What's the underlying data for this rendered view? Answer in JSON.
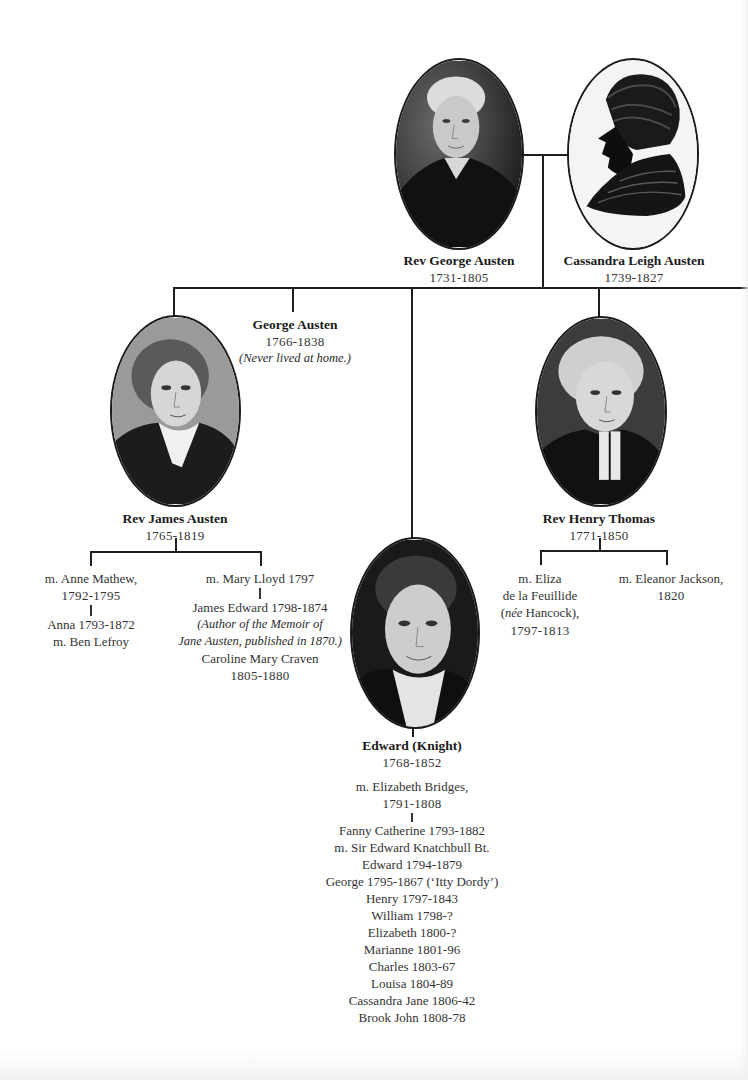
{
  "parents": {
    "father": {
      "name": "Rev George Austen",
      "dates": "1731-1805",
      "portrait": "portrait-painted"
    },
    "mother": {
      "name": "Cassandra Leigh Austen",
      "dates": "1739-1827",
      "portrait": "silhouette"
    }
  },
  "children": {
    "james": {
      "name": "Rev James Austen",
      "dates": "1765-1819",
      "marriages": [
        {
          "spouse": "m. Anne Mathew,",
          "years": "1792-1795",
          "children": [
            "Anna 1793-1872",
            "m. Ben Lefroy"
          ]
        },
        {
          "spouse": "m. Mary Lloyd 1797",
          "children_line1": "James Edward 1798-1874",
          "note_line1": "(Author of the Memoir of",
          "note_line2": "Jane Austen, published in 1870.)",
          "child2_name": "Caroline Mary Craven",
          "child2_dates": "1805-1880"
        }
      ]
    },
    "george": {
      "name": "George Austen",
      "dates": "1766-1838",
      "note": "(Never lived at home.)"
    },
    "edward": {
      "name": "Edward (Knight)",
      "dates": "1768-1852",
      "marriage": {
        "spouse": "m. Elizabeth Bridges,",
        "years": "1791-1808"
      },
      "children": [
        "Fanny Catherine  1793-1882",
        "m. Sir Edward Knatchbull Bt.",
        "Edward 1794-1879",
        "George 1795-1867 (‘Itty Dordy’)",
        "Henry 1797-1843",
        "William 1798-?",
        "Elizabeth 1800-?",
        "Marianne 1801-96",
        "Charles 1803-67",
        "Louisa 1804-89",
        "Cassandra Jane 1806-42",
        "Brook John 1808-78"
      ]
    },
    "henry": {
      "name": "Rev Henry Thomas",
      "dates": "1771-1850",
      "marriages": [
        {
          "line1": "m. Eliza",
          "line2": "de la Feuillide",
          "line3_italic": "née",
          "line3_rest": " Hancock),",
          "line3_open": "(",
          "years": "1797-1813"
        },
        {
          "line1": "m. Eleanor Jackson,",
          "years": "1820"
        }
      ]
    }
  }
}
